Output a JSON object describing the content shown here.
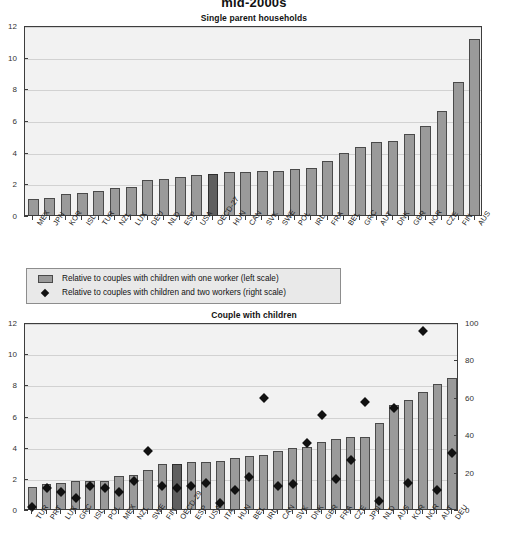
{
  "figure": {
    "title": "mid-2000s"
  },
  "legend": {
    "items": [
      {
        "marker": "bar-swatch",
        "label": "Relative to couples with children with one worker (left scale)"
      },
      {
        "marker": "diamond-marker",
        "label": "Relative to couples with children and two workers (right scale)"
      }
    ]
  },
  "chart_data": [
    {
      "type": "bar",
      "title": "Single parent households",
      "xlabel": "",
      "ylabel": "",
      "ylim": [
        0,
        12
      ],
      "yticks": [
        0,
        2,
        4,
        6,
        8,
        10,
        12
      ],
      "grid": true,
      "highlight_category": "OECD-27",
      "categories": [
        "MEX",
        "JPN",
        "KOR",
        "ISL",
        "TUR",
        "NZL",
        "LUX",
        "DEU",
        "NLD",
        "ESP",
        "USA",
        "OECD-27",
        "HUN",
        "CAN",
        "SVK",
        "SWE",
        "POL",
        "IRL",
        "FRA",
        "BEL",
        "GRC",
        "AUT",
        "DNK",
        "GBR",
        "NOR",
        "CZE",
        "FIN",
        "AUS"
      ],
      "values": [
        1.0,
        1.1,
        1.3,
        1.4,
        1.5,
        1.7,
        1.8,
        2.2,
        2.3,
        2.4,
        2.5,
        2.6,
        2.7,
        2.7,
        2.8,
        2.8,
        2.9,
        3.0,
        3.4,
        3.9,
        4.3,
        4.6,
        4.7,
        5.1,
        5.6,
        6.6,
        8.4,
        11.1
      ]
    },
    {
      "type": "bar+scatter",
      "title": "Couple with children",
      "xlabel": "",
      "ylabel": "",
      "ylim": [
        0,
        12
      ],
      "yticks": [
        0,
        2,
        4,
        6,
        8,
        10,
        12
      ],
      "y2lim": [
        0,
        100
      ],
      "y2ticks": [
        0,
        20,
        40,
        60,
        80,
        100
      ],
      "grid": true,
      "highlight_category": "OECD-29",
      "categories": [
        "TUR",
        "PRT",
        "LUX",
        "GRC",
        "ISL",
        "POL",
        "MEX",
        "NZL",
        "SWE",
        "FIN",
        "OECD-29",
        "ESP",
        "USA",
        "ITA",
        "HUN",
        "BEL",
        "IRL",
        "CAN",
        "SVK",
        "DNK",
        "GBR",
        "FRA",
        "CZE",
        "JPN",
        "NLD",
        "AUS",
        "KOR",
        "NOR",
        "AUT",
        "DEU"
      ],
      "series": [
        {
          "name": "Relative to couples with children with one worker (left scale)",
          "axis": "left",
          "values": [
            1.4,
            1.6,
            1.7,
            1.8,
            1.8,
            1.8,
            2.1,
            2.2,
            2.5,
            2.9,
            2.9,
            3.0,
            3.0,
            3.1,
            3.3,
            3.4,
            3.5,
            3.7,
            3.9,
            4.0,
            4.3,
            4.5,
            4.6,
            4.6,
            5.5,
            6.7,
            7.0,
            7.5,
            8.0,
            8.4
          ]
        },
        {
          "name": "Relative to couples with children and two workers (right scale)",
          "axis": "right",
          "values": [
            3,
            13,
            11,
            8,
            14,
            13,
            11,
            17,
            33,
            14,
            13,
            14,
            16,
            5,
            12,
            19,
            61,
            14,
            15,
            37,
            52,
            18,
            28,
            59,
            6,
            56,
            16,
            97,
            12,
            32
          ]
        }
      ]
    }
  ]
}
